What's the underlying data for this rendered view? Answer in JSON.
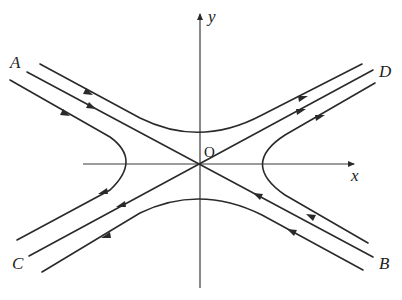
{
  "diagram": {
    "axes": {
      "x_label": "x",
      "y_label": "y",
      "origin_label": "O"
    },
    "point_labels": {
      "A": "A",
      "B": "B",
      "C": "C",
      "D": "D"
    },
    "trajectories": [
      {
        "name": "upper-branch",
        "direction": "left-to-right (A side to D side)"
      },
      {
        "name": "lower-branch",
        "direction": "right-to-left (B side to C side)"
      },
      {
        "name": "left-branch",
        "direction": "upper-left to lower-left (toward C)"
      },
      {
        "name": "right-branch",
        "direction": "lower-right to upper-right (toward D)"
      },
      {
        "name": "stable-asymptote-AB",
        "direction": "inward to O from A and from B"
      },
      {
        "name": "unstable-asymptote-CD",
        "direction": "outward from O toward C and D"
      }
    ],
    "colors": {
      "stroke": "#2a2a2a",
      "background": "#ffffff"
    }
  }
}
